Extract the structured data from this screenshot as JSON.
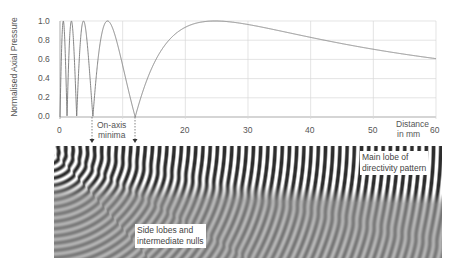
{
  "chart_data": {
    "type": "line",
    "title": "",
    "xlabel": "Distance in mm",
    "ylabel": "Normalised Axial Pressure",
    "xlim": [
      0,
      60
    ],
    "ylim": [
      0,
      1.0
    ],
    "x_ticks": [
      "0",
      "10",
      "20",
      "30",
      "40",
      "50",
      "60"
    ],
    "x_tick_labels_visible": [
      "0",
      "20",
      "30",
      "40",
      "50",
      "60"
    ],
    "y_ticks": [
      "0.0",
      "0.2",
      "0.4",
      "0.6",
      "0.8",
      "1.0"
    ],
    "grid": true,
    "series": [
      {
        "name": "On-axis pressure",
        "formula": "|sin(pi*(sqrt(z^2+25)-z))|",
        "x": [
          0,
          0.2,
          0.5,
          1.1,
          1.6,
          2.0,
          2.7,
          3.5,
          4.2,
          5.25,
          7.5,
          10,
          12,
          14,
          17,
          20,
          25,
          30,
          35,
          40,
          45,
          50,
          55,
          60
        ],
        "values": [
          0,
          1.0,
          0.6,
          0.0,
          1.0,
          0.6,
          0.0,
          1.0,
          0.6,
          0.0,
          1.0,
          0.5,
          0.0,
          0.43,
          0.81,
          0.95,
          1.0,
          0.97,
          0.92,
          0.86,
          0.79,
          0.73,
          0.67,
          0.63
        ]
      }
    ]
  },
  "axes": {
    "ylabel": "Normalised Axial Pressure",
    "xlabel_line1": "Distance",
    "xlabel_line2": "in mm",
    "x_tick_0": "0",
    "x_tick_20": "20",
    "x_tick_30": "30",
    "x_tick_40": "40",
    "x_tick_50": "50",
    "x_tick_60": "60",
    "y_ticks": [
      "1.0",
      "0.8",
      "0.6",
      "0.4",
      "0.2",
      "0.0"
    ]
  },
  "annotations": {
    "on_axis_minima_line1": "On-axis",
    "on_axis_minima_line2": "minima",
    "main_lobe_line1": "Main lobe of",
    "main_lobe_line2": "directivity pattern",
    "side_lobes_line1": "Side lobes and",
    "side_lobes_line2": "intermediate nulls"
  },
  "colors": {
    "curve": "#777777",
    "grid": "#d8d8d8",
    "axis": "#888888",
    "text": "#555555"
  }
}
